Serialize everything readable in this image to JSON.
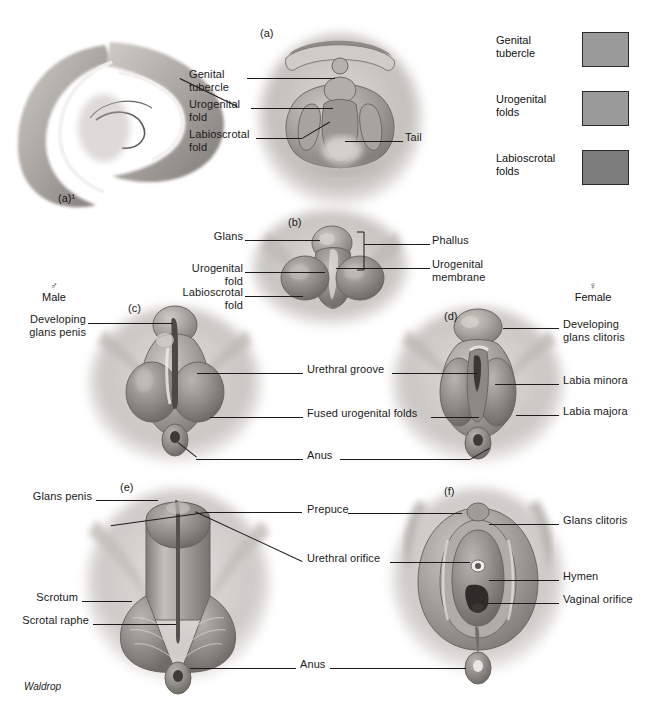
{
  "figure": {
    "signature": "Waldrop",
    "panel_letters": {
      "a1": "(a)¹",
      "a": "(a)",
      "b": "(b)",
      "c": "(c)",
      "d": "(d)",
      "e": "(e)",
      "f": "(f)"
    },
    "sex_headers": {
      "male": {
        "symbol": "♂",
        "label": "Male"
      },
      "female": {
        "symbol": "♀",
        "label": "Female"
      }
    }
  },
  "legend": {
    "items": [
      {
        "label": "Genital\ntubercle",
        "color": "#9a9a9a"
      },
      {
        "label": "Urogenital\nfolds",
        "color": "#9a9a9a"
      },
      {
        "label": "Labioscrotal\nfolds",
        "color": "#7d7d7d"
      }
    ]
  },
  "labels": {
    "genital_tubercle": "Genital\ntubercle",
    "urogenital_fold": "Urogenital\nfold",
    "labioscrotal_fold": "Labioscrotal\nfold",
    "tail": "Tail",
    "glans": "Glans",
    "urogenital_fold_b": "Urogenital\nfold",
    "labioscrotal_fold_b": "Labioscrotal\nfold",
    "phallus": "Phallus",
    "urogenital_membrane": "Urogenital\nmembrane",
    "developing_glans_penis": "Developing\nglans penis",
    "developing_glans_clitoris": "Developing\nglans clitoris",
    "urethral_groove": "Urethral groove",
    "fused_urogenital_folds": "Fused urogenital folds",
    "anus_mid": "Anus",
    "labia_minora": "Labia minora",
    "labia_majora": "Labia majora",
    "glans_penis": "Glans penis",
    "scrotum": "Scrotum",
    "scrotal_raphe": "Scrotal raphe",
    "prepuce": "Prepuce",
    "urethral_orifice": "Urethral orifice",
    "glans_clitoris": "Glans clitoris",
    "hymen": "Hymen",
    "vaginal_orifice": "Vaginal orifice",
    "anus_bottom": "Anus"
  },
  "colors": {
    "ink": "#1b1b1b",
    "tissue_light": "#c9c6c2",
    "tissue_mid": "#a39f9b",
    "tissue_dark": "#7b7773",
    "background": "#ffffff"
  }
}
